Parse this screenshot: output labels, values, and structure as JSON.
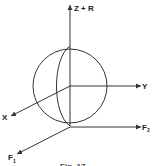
{
  "diagram": {
    "labels": {
      "z_axis": "Z + R",
      "y_axis": "Y",
      "x_axis": "X",
      "f1": "F",
      "f1_sub": "1",
      "f2": "F",
      "f2_sub": "2"
    },
    "caption": "Fig. 17",
    "colors": {
      "stroke": "#333333",
      "background": "#ffffff"
    }
  }
}
